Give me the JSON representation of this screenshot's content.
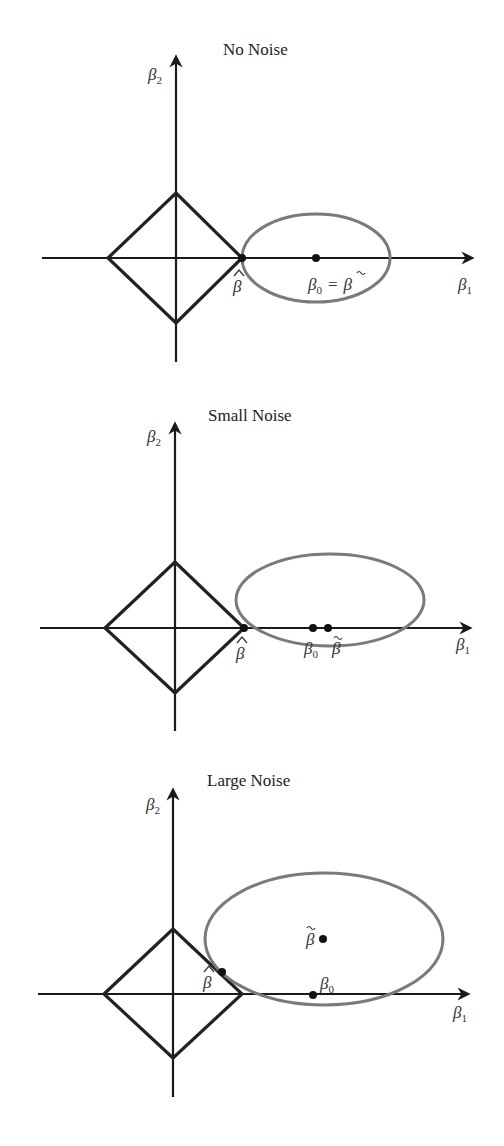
{
  "figure": {
    "panels": [
      {
        "title": "No Noise",
        "axis_x_label": "β",
        "axis_x_sub": "1",
        "axis_y_label": "β",
        "axis_y_sub": "2",
        "points": [
          {
            "name": "beta-hat",
            "label": "β̂",
            "x": 242,
            "y": 258
          },
          {
            "name": "beta-0-equals-beta-tilde",
            "label": "β₀ = β̃",
            "x": 316,
            "y": 258
          }
        ],
        "labels": {
          "beta_hat": "β",
          "beta0": "β",
          "beta0_sub": "0",
          "eq": "=",
          "beta_tilde": "β"
        }
      },
      {
        "title": "Small Noise",
        "axis_x_label": "β",
        "axis_x_sub": "1",
        "axis_y_label": "β",
        "axis_y_sub": "2",
        "points": [
          {
            "name": "beta-hat",
            "label": "β̂",
            "x": 244,
            "y": 628
          },
          {
            "name": "beta-0",
            "label": "β₀",
            "x": 313,
            "y": 628
          },
          {
            "name": "beta-tilde",
            "label": "β̃",
            "x": 328,
            "y": 628
          }
        ],
        "labels": {
          "beta_hat": "β",
          "beta0": "β",
          "beta0_sub": "0",
          "beta_tilde": "β"
        }
      },
      {
        "title": "Large Noise",
        "axis_x_label": "β",
        "axis_x_sub": "1",
        "axis_y_label": "β",
        "axis_y_sub": "2",
        "points": [
          {
            "name": "beta-tilde",
            "label": "β̃",
            "x": 323,
            "y": 939
          },
          {
            "name": "beta-hat",
            "label": "β̂",
            "x": 222,
            "y": 972
          },
          {
            "name": "beta-0",
            "label": "β₀",
            "x": 313,
            "y": 995
          }
        ],
        "labels": {
          "beta_hat": "β",
          "beta0": "β",
          "beta0_sub": "0",
          "beta_tilde": "β"
        }
      }
    ],
    "colors": {
      "axis": "#1a1a1a",
      "diamond": "#222222",
      "ellipse": "#7a7a7a",
      "point": "#111111"
    }
  }
}
